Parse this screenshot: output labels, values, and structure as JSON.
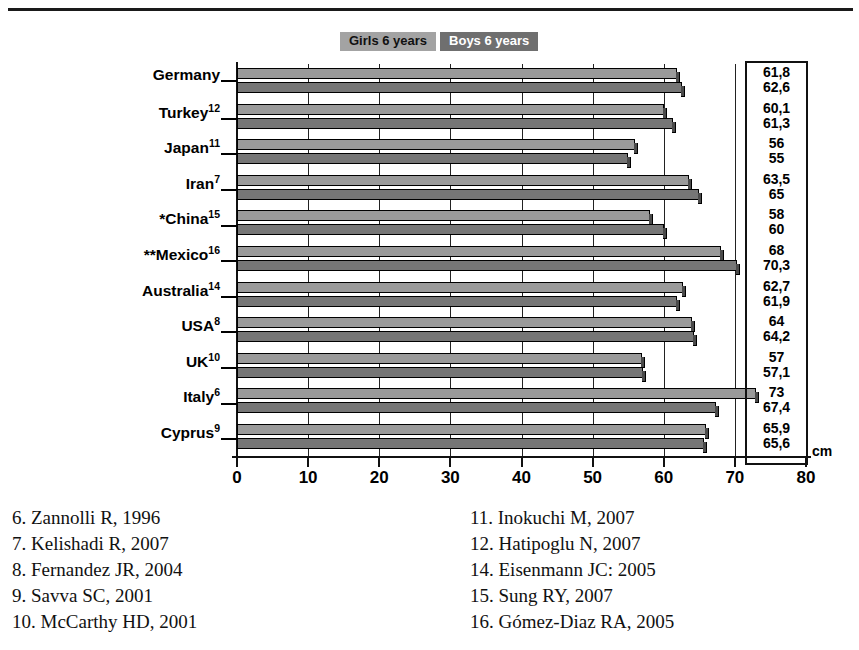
{
  "legend": {
    "girls_label": "Girls 6 years",
    "boys_label": "Boys 6 years",
    "girls_color": "#a3a3a3",
    "boys_color": "#6f6f6f"
  },
  "axis": {
    "unit_label": "cm",
    "ticks": [
      "0",
      "10",
      "20",
      "30",
      "40",
      "50",
      "60",
      "70",
      "80"
    ]
  },
  "categories": [
    {
      "name": "Germany",
      "prefix": "",
      "ref": ""
    },
    {
      "name": "Turkey",
      "prefix": "",
      "ref": "12"
    },
    {
      "name": "Japan",
      "prefix": "",
      "ref": "11"
    },
    {
      "name": "Iran",
      "prefix": "",
      "ref": "7"
    },
    {
      "name": "China",
      "prefix": "*",
      "ref": "15"
    },
    {
      "name": "Mexico",
      "prefix": "**",
      "ref": "16"
    },
    {
      "name": "Australia",
      "prefix": "",
      "ref": "14"
    },
    {
      "name": "USA",
      "prefix": "",
      "ref": "8"
    },
    {
      "name": "UK",
      "prefix": "",
      "ref": "10"
    },
    {
      "name": "Italy",
      "prefix": "",
      "ref": "6"
    },
    {
      "name": "Cyprus",
      "prefix": "",
      "ref": "9"
    }
  ],
  "value_labels": [
    {
      "girls": "61,8",
      "boys": "62,6"
    },
    {
      "girls": "60,1",
      "boys": "61,3"
    },
    {
      "girls": "56",
      "boys": "55"
    },
    {
      "girls": "63,5",
      "boys": "65"
    },
    {
      "girls": "58",
      "boys": "60"
    },
    {
      "girls": "68",
      "boys": "70,3"
    },
    {
      "girls": "62,7",
      "boys": "61,9"
    },
    {
      "girls": "64",
      "boys": "64,2"
    },
    {
      "girls": "57",
      "boys": "57,1"
    },
    {
      "girls": "73",
      "boys": "67,4"
    },
    {
      "girls": "65,9",
      "boys": "65,6"
    }
  ],
  "references": {
    "left": [
      "6. Zannolli R, 1996",
      "7. Kelishadi R, 2007",
      "8. Fernandez JR, 2004",
      "9. Savva SC, 2001",
      "10. McCarthy HD, 2001"
    ],
    "right": [
      "11. Inokuchi M, 2007",
      "12. Hatipoglu N, 2007",
      "14. Eisenmann JC: 2005",
      "15. Sung RY, 2007",
      "16. Gómez-Diaz RA, 2005"
    ]
  },
  "chart_data": {
    "type": "bar",
    "title": "",
    "xlabel": "cm",
    "ylabel": "",
    "orientation": "horizontal",
    "xlim": [
      0,
      80
    ],
    "grid": true,
    "legend_position": "top",
    "categories": [
      "Germany",
      "Turkey",
      "Japan",
      "Iran",
      "*China",
      "**Mexico",
      "Australia",
      "USA",
      "UK",
      "Italy",
      "Cyprus"
    ],
    "series": [
      {
        "name": "Girls 6 years",
        "color": "#9a9a9a",
        "values": [
          61.8,
          60.1,
          56,
          63.5,
          58,
          68,
          62.7,
          64,
          57,
          73,
          65.9
        ]
      },
      {
        "name": "Boys 6 years",
        "color": "#767676",
        "values": [
          62.6,
          61.3,
          55,
          65,
          60,
          70.3,
          61.9,
          64.2,
          57.1,
          67.4,
          65.6
        ]
      }
    ]
  }
}
